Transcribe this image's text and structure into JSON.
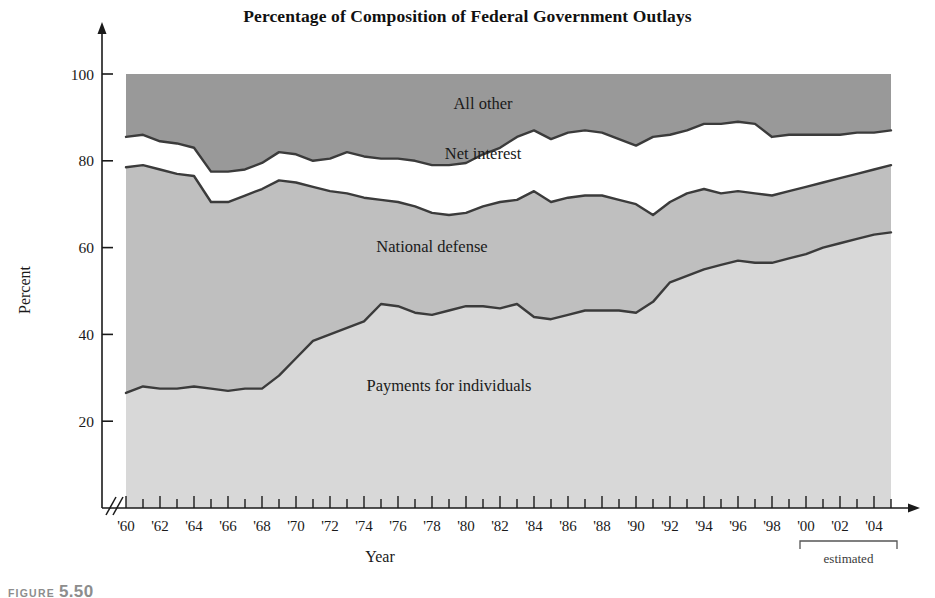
{
  "figure": {
    "caption_word": "FIGURE",
    "caption_number": "5.50"
  },
  "chart_data": {
    "type": "area",
    "title": "Percentage of Composition of Federal Government Outlays",
    "xlabel": "Year",
    "ylabel": "Percent",
    "ylim": [
      0,
      100
    ],
    "yticks": [
      20,
      40,
      60,
      80,
      100
    ],
    "ytick_labels": [
      "20",
      "40",
      "60",
      "80",
      "100"
    ],
    "grid": false,
    "legend_position": "inline-band-labels",
    "axis_break": true,
    "x": [
      1960,
      1961,
      1962,
      1963,
      1964,
      1965,
      1966,
      1967,
      1968,
      1969,
      1970,
      1971,
      1972,
      1973,
      1974,
      1975,
      1976,
      1977,
      1978,
      1979,
      1980,
      1981,
      1982,
      1983,
      1984,
      1985,
      1986,
      1987,
      1988,
      1989,
      1990,
      1991,
      1992,
      1993,
      1994,
      1995,
      1996,
      1997,
      1998,
      1999,
      2000,
      2001,
      2002,
      2003,
      2004,
      2005
    ],
    "xtick_labels": [
      "'60",
      "'62",
      "'64",
      "'66",
      "'68",
      "'70",
      "'72",
      "'74",
      "'76",
      "'78",
      "'80",
      "'82",
      "'84",
      "'86",
      "'88",
      "'90",
      "'92",
      "'94",
      "'96",
      "'98",
      "'00",
      "'02",
      "'04"
    ],
    "xtick_step_years": 2,
    "annotations": [
      {
        "text": "estimated",
        "from_year": 2000,
        "to_year": 2005
      }
    ],
    "stack_order_bottom_to_top": [
      "Payments for individuals",
      "National defense",
      "Net interest",
      "All other"
    ],
    "series": [
      {
        "name": "Payments for individuals",
        "label": "Payments for individuals",
        "color": "#d8d8d8",
        "cumulative_top": [
          26.5,
          28.0,
          27.5,
          27.5,
          28.0,
          27.5,
          27.0,
          27.5,
          27.5,
          30.5,
          34.5,
          38.5,
          40.0,
          41.5,
          43.0,
          47.0,
          46.5,
          45.0,
          44.5,
          45.5,
          46.5,
          46.5,
          46.0,
          47.0,
          44.0,
          43.5,
          44.5,
          45.5,
          45.5,
          45.5,
          45.0,
          47.5,
          52.0,
          53.5,
          55.0,
          56.0,
          57.0,
          56.5,
          56.5,
          57.5,
          58.5,
          60.0,
          61.0,
          62.0,
          63.0,
          63.5
        ]
      },
      {
        "name": "National defense",
        "label": "National defense",
        "color": "#bfbfbf",
        "cumulative_top": [
          78.5,
          79.0,
          78.0,
          77.0,
          76.5,
          70.5,
          70.5,
          72.0,
          73.5,
          75.5,
          75.0,
          74.0,
          73.0,
          72.5,
          71.5,
          71.0,
          70.5,
          69.5,
          68.0,
          67.5,
          68.0,
          69.5,
          70.5,
          71.0,
          73.0,
          70.5,
          71.5,
          72.0,
          72.0,
          71.0,
          70.0,
          67.5,
          70.5,
          72.5,
          73.5,
          72.5,
          73.0,
          72.5,
          72.0,
          73.0,
          74.0,
          75.0,
          76.0,
          77.0,
          78.0,
          79.0
        ]
      },
      {
        "name": "Net interest",
        "label": "Net interest",
        "color": "#ffffff",
        "cumulative_top": [
          85.5,
          86.0,
          84.5,
          84.0,
          83.0,
          77.5,
          77.5,
          78.0,
          79.5,
          82.0,
          81.5,
          80.0,
          80.5,
          82.0,
          81.0,
          80.5,
          80.5,
          80.0,
          79.0,
          79.0,
          79.5,
          81.5,
          83.0,
          85.5,
          87.0,
          85.0,
          86.5,
          87.0,
          86.5,
          85.0,
          83.5,
          85.5,
          86.0,
          87.0,
          88.5,
          88.5,
          89.0,
          88.5,
          85.5,
          86.0,
          86.0,
          86.0,
          86.0,
          86.5,
          86.5,
          87.0
        ]
      },
      {
        "name": "All other",
        "label": "All other",
        "color": "#999999",
        "cumulative_top": [
          100,
          100,
          100,
          100,
          100,
          100,
          100,
          100,
          100,
          100,
          100,
          100,
          100,
          100,
          100,
          100,
          100,
          100,
          100,
          100,
          100,
          100,
          100,
          100,
          100,
          100,
          100,
          100,
          100,
          100,
          100,
          100,
          100,
          100,
          100,
          100,
          100,
          100,
          100,
          100,
          100,
          100,
          100,
          100,
          100,
          100
        ]
      }
    ],
    "band_label_positions": [
      {
        "label": "All other",
        "year": 1981,
        "percent": 92
      },
      {
        "label": "Net interest",
        "year": 1981,
        "percent": 80.5
      },
      {
        "label": "National defense",
        "year": 1978,
        "percent": 59
      },
      {
        "label": "Payments for individuals",
        "year": 1979,
        "percent": 27
      }
    ]
  }
}
